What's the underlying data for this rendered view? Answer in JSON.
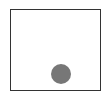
{
  "diagram": {
    "frame": {
      "x": 10,
      "y": 9,
      "width": 91,
      "height": 82,
      "stroke": "#333333"
    },
    "circle": {
      "cx": 61,
      "cy": 74,
      "r": 10,
      "fill": "#777777"
    }
  }
}
